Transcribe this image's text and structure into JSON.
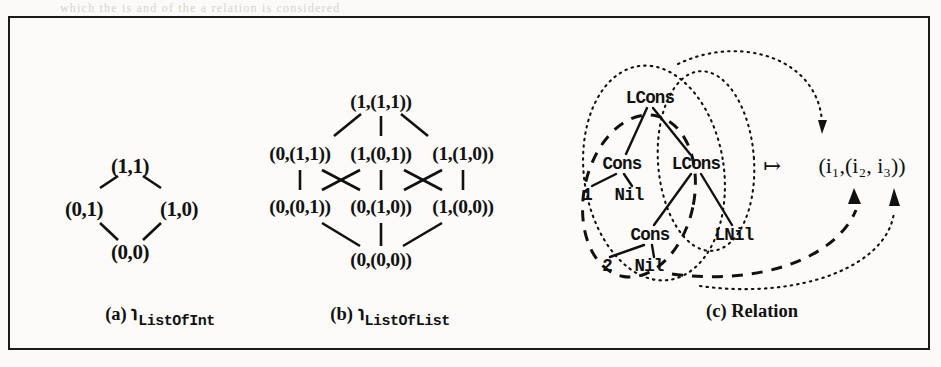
{
  "figure": {
    "panels": [
      {
        "id": "a",
        "caption_prefix": "(a)",
        "caption_symbol": "℩",
        "caption_subscript": "ListOfInt",
        "type": "hasse-lattice",
        "nodes": [
          {
            "id": "a-top",
            "label": "(1,1)",
            "x": 120,
            "y": 148
          },
          {
            "id": "a-left",
            "label": "(0,1)",
            "x": 74,
            "y": 191
          },
          {
            "id": "a-right",
            "label": "(1,0)",
            "x": 169,
            "y": 191
          },
          {
            "id": "a-bot",
            "label": "(0,0)",
            "x": 120,
            "y": 234
          }
        ],
        "edges": [
          [
            "a-left",
            "a-top"
          ],
          [
            "a-right",
            "a-top"
          ],
          [
            "a-left",
            "a-bot"
          ],
          [
            "a-right",
            "a-bot"
          ]
        ]
      },
      {
        "id": "b",
        "caption_prefix": "(b)",
        "caption_symbol": "℩",
        "caption_subscript": "ListOfList",
        "type": "hasse-lattice",
        "nodes": [
          {
            "id": "b-top",
            "label": "(1,(1,1))",
            "x": 371,
            "y": 84
          },
          {
            "id": "b-m1",
            "label": "(0,(1,1))",
            "x": 290,
            "y": 136
          },
          {
            "id": "b-m2",
            "label": "(1,(0,1))",
            "x": 371,
            "y": 136
          },
          {
            "id": "b-m3",
            "label": "(1,(1,0))",
            "x": 453,
            "y": 136
          },
          {
            "id": "b-l1",
            "label": "(0,(0,1))",
            "x": 290,
            "y": 189
          },
          {
            "id": "b-l2",
            "label": "(0,(1,0))",
            "x": 371,
            "y": 189
          },
          {
            "id": "b-l3",
            "label": "(1,(0,0))",
            "x": 453,
            "y": 189
          },
          {
            "id": "b-bot",
            "label": "(0,(0,0))",
            "x": 371,
            "y": 242
          }
        ],
        "edges": [
          [
            "b-m1",
            "b-top"
          ],
          [
            "b-m2",
            "b-top"
          ],
          [
            "b-m3",
            "b-top"
          ],
          [
            "b-l1",
            "b-m1"
          ],
          [
            "b-l2",
            "b-m1"
          ],
          [
            "b-l1",
            "b-m2"
          ],
          [
            "b-l2",
            "b-m2"
          ],
          [
            "b-l3",
            "b-m2"
          ],
          [
            "b-l2",
            "b-m3"
          ],
          [
            "b-l3",
            "b-m3"
          ],
          [
            "b-bot",
            "b-l1"
          ],
          [
            "b-bot",
            "b-l2"
          ],
          [
            "b-bot",
            "b-l3"
          ]
        ]
      },
      {
        "id": "c",
        "caption_prefix": "(c)",
        "caption_text": "Relation",
        "type": "term-tree-relation",
        "nodes": [
          {
            "id": "t-lcons1",
            "label": "LCons",
            "x": 640,
            "y": 80
          },
          {
            "id": "t-cons1",
            "label": "Cons",
            "x": 612,
            "y": 146
          },
          {
            "id": "t-lcons2",
            "label": "LCons",
            "x": 686,
            "y": 146
          },
          {
            "id": "t-one",
            "label": "1",
            "x": 577,
            "y": 177
          },
          {
            "id": "t-nil1",
            "label": "Nil",
            "x": 619,
            "y": 177
          },
          {
            "id": "t-cons2",
            "label": "Cons",
            "x": 640,
            "y": 217
          },
          {
            "id": "t-lnil",
            "label": "LNil",
            "x": 724,
            "y": 217
          },
          {
            "id": "t-two",
            "label": "2",
            "x": 597,
            "y": 248
          },
          {
            "id": "t-nil2",
            "label": "Nil",
            "x": 639,
            "y": 248
          }
        ],
        "edges": [
          [
            "t-lcons1",
            "t-cons1"
          ],
          [
            "t-lcons1",
            "t-lcons2"
          ],
          [
            "t-cons1",
            "t-one"
          ],
          [
            "t-cons1",
            "t-nil1"
          ],
          [
            "t-lcons2",
            "t-cons2"
          ],
          [
            "t-lcons2",
            "t-lnil"
          ],
          [
            "t-cons2",
            "t-two"
          ],
          [
            "t-cons2",
            "t-nil2"
          ]
        ],
        "mapsto_symbol": "↦",
        "tuple_text": "(i₁,(i₂, i₃))",
        "tuple_components": [
          "i1",
          "i2",
          "i3"
        ],
        "groupings": [
          {
            "name": "outer-dotted-ellipse",
            "style": "dotted",
            "target": "i1"
          },
          {
            "name": "inner-dotted-ellipse",
            "style": "dotted",
            "target": "i3"
          },
          {
            "name": "dashed-ellipse",
            "style": "dashed",
            "target": "i2"
          }
        ]
      }
    ],
    "captions": [
      {
        "x": 150,
        "y": 291
      },
      {
        "x": 380,
        "y": 291
      },
      {
        "x": 740,
        "y": 291
      }
    ]
  },
  "colors": {
    "ink": "#111111",
    "page": "#fbfaf8",
    "frame": "#1a1a1a"
  },
  "scan_artifacts": {
    "top_line": "which the  is  and  of  the  a  relation  is  considered"
  }
}
